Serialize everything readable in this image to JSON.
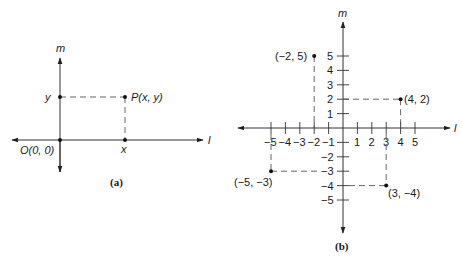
{
  "figure_a": {
    "caption": "(a)",
    "axis_x_label": "l",
    "axis_y_label": "m",
    "origin_label": "O(0, 0)",
    "point_label": "P(x, y)",
    "x_tick_label": "x",
    "y_tick_label": "y"
  },
  "figure_b": {
    "caption": "(b)",
    "axis_x_label": "l",
    "axis_y_label": "m",
    "x_ticks": [
      "-5",
      "-4",
      "-3",
      "-2",
      "-1",
      "1",
      "2",
      "3",
      "4",
      "5"
    ],
    "y_ticks": [
      "5",
      "4",
      "3",
      "2",
      "1",
      "-2",
      "-3",
      "-4",
      "-5"
    ],
    "points": [
      {
        "label": "(−2, 5)",
        "x": -2,
        "y": 5
      },
      {
        "label": "(4, 2)",
        "x": 4,
        "y": 2
      },
      {
        "label": "(−5, −3)",
        "x": -5,
        "y": -3
      },
      {
        "label": "(3, −4)",
        "x": 3,
        "y": -4
      }
    ]
  },
  "tick_text": {
    "xm5": "−5",
    "xm4": "−4",
    "xm3": "−3",
    "xm2": "−2",
    "xm1": "−1",
    "x1": "1",
    "x2": "2",
    "x3": "3",
    "x4": "4",
    "x5": "5",
    "y5": "5",
    "y4": "4",
    "y3": "3",
    "y2": "2",
    "y1": "1",
    "ym2": "−2",
    "ym3": "−3",
    "ym4": "−4",
    "ym5": "−5"
  }
}
